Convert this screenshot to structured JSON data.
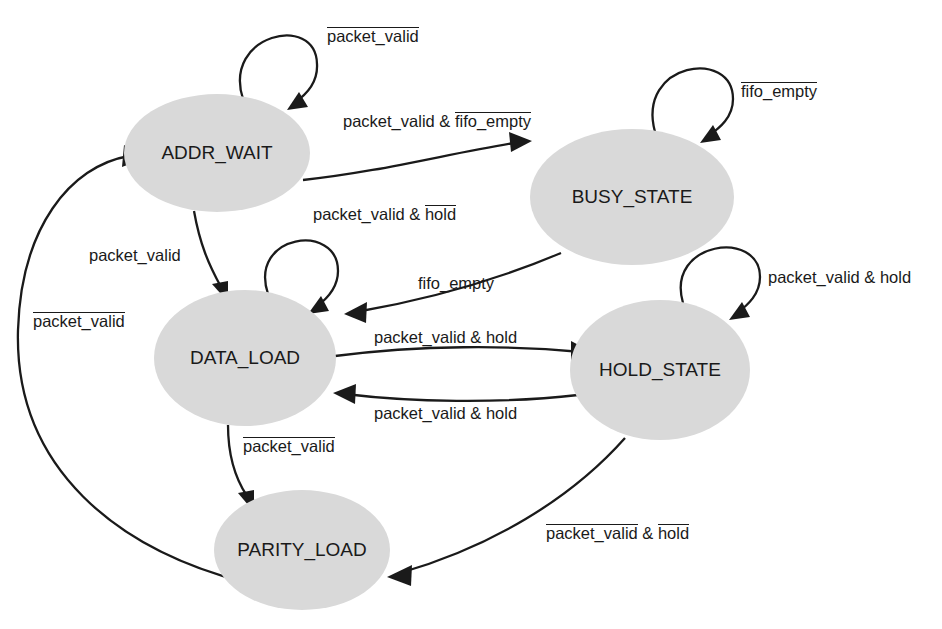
{
  "diagram": {
    "background_color": "#ffffff",
    "state_fill_color": "#d9d9d9",
    "line_color": "#1a1a1a",
    "states": [
      {
        "id": "addr_wait",
        "label": "ADDR_WAIT",
        "cx": 217,
        "cy": 153,
        "rx": 93,
        "ry": 59
      },
      {
        "id": "busy_state",
        "label": "BUSY_STATE",
        "cx": 632,
        "cy": 197,
        "rx": 102,
        "ry": 68
      },
      {
        "id": "data_load",
        "label": "DATA_LOAD",
        "cx": 245,
        "cy": 358,
        "rx": 91,
        "ry": 68
      },
      {
        "id": "hold_state",
        "label": "HOLD_STATE",
        "cx": 660,
        "cy": 370,
        "rx": 90,
        "ry": 70
      },
      {
        "id": "parity_load",
        "label": "PARITY_LOAD",
        "cx": 302,
        "cy": 550,
        "rx": 88,
        "ry": 60
      }
    ],
    "transitions": [
      {
        "id": "addr-wait-self",
        "from": "addr_wait",
        "to": "addr_wait",
        "label_parts": [
          {
            "text": "packet_valid",
            "overline": true
          }
        ],
        "label_x": 327,
        "label_y": 27
      },
      {
        "id": "addr-wait-to-busy",
        "from": "addr_wait",
        "to": "busy_state",
        "label_parts": [
          {
            "text": "packet_valid & ",
            "overline": false
          },
          {
            "text": "fifo_empty",
            "overline": true
          }
        ],
        "label_x": 343,
        "label_y": 112
      },
      {
        "id": "busy-self",
        "from": "busy_state",
        "to": "busy_state",
        "label_parts": [
          {
            "text": "fifo_empty",
            "overline": true
          }
        ],
        "label_x": 741,
        "label_y": 82
      },
      {
        "id": "addr-wait-to-data-load",
        "from": "addr_wait",
        "to": "data_load",
        "label_parts": [
          {
            "text": "packet_valid",
            "overline": false
          }
        ],
        "label_x": 89,
        "label_y": 246
      },
      {
        "id": "data-load-self",
        "from": "data_load",
        "to": "data_load",
        "label_parts": [
          {
            "text": "packet_valid & ",
            "overline": false
          },
          {
            "text": "hold",
            "overline": true
          }
        ],
        "label_x": 313,
        "label_y": 205
      },
      {
        "id": "busy-to-data-load",
        "from": "busy_state",
        "to": "data_load",
        "label_parts": [
          {
            "text": "fifo_empty",
            "overline": false
          }
        ],
        "label_x": 418,
        "label_y": 274
      },
      {
        "id": "hold-self",
        "from": "hold_state",
        "to": "hold_state",
        "label_parts": [
          {
            "text": "packet_valid & hold",
            "overline": false
          }
        ],
        "label_x": 768,
        "label_y": 268
      },
      {
        "id": "data-load-to-hold",
        "from": "data_load",
        "to": "hold_state",
        "label_parts": [
          {
            "text": "packet_valid & hold",
            "overline": false
          }
        ],
        "label_x": 374,
        "label_y": 328
      },
      {
        "id": "hold-to-data-load",
        "from": "hold_state",
        "to": "data_load",
        "label_parts": [
          {
            "text": "packet_valid & hold",
            "overline": false
          }
        ],
        "label_x": 374,
        "label_y": 404
      },
      {
        "id": "data-load-to-parity",
        "from": "data_load",
        "to": "parity_load",
        "label_parts": [
          {
            "text": "packet_valid",
            "overline": true
          }
        ],
        "label_x": 243,
        "label_y": 437
      },
      {
        "id": "hold-to-parity",
        "from": "hold_state",
        "to": "parity_load",
        "label_parts": [
          {
            "text": "packet_valid",
            "overline": true
          },
          {
            "text": " & ",
            "overline": false
          },
          {
            "text": "hold",
            "overline": true
          }
        ],
        "label_x": 546,
        "label_y": 524
      },
      {
        "id": "parity-to-addr-wait",
        "from": "parity_load",
        "to": "addr_wait",
        "label_parts": [
          {
            "text": "packet_valid",
            "overline": true
          }
        ],
        "label_x": 33,
        "label_y": 312
      }
    ]
  }
}
